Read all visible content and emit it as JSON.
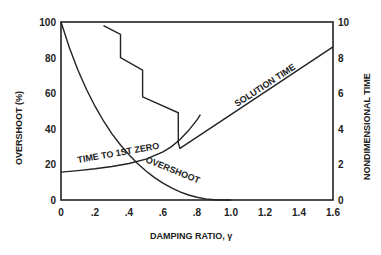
{
  "chart_data": {
    "type": "line",
    "title": "",
    "xlabel": "DAMPING RATIO, γ",
    "ylabel": "OVERSHOOT (%)",
    "y2label": "NONDIMENSIONAL TIME",
    "xlim": [
      0,
      1.6
    ],
    "ylim": [
      0,
      100
    ],
    "y2lim": [
      0,
      10
    ],
    "x_ticks": [
      "0",
      ".2",
      ".4",
      ".6",
      ".8",
      "1.0",
      "1.2",
      "1.4",
      "1.6"
    ],
    "x_tick_values": [
      0,
      0.2,
      0.4,
      0.6,
      0.8,
      1.0,
      1.2,
      1.4,
      1.6
    ],
    "y_ticks": [
      "0",
      "20",
      "40",
      "60",
      "80",
      "100"
    ],
    "y_tick_values": [
      0,
      20,
      40,
      60,
      80,
      100
    ],
    "y2_ticks": [
      "0",
      "2",
      "4",
      "6",
      "8",
      "10"
    ],
    "y2_tick_values": [
      0,
      2,
      4,
      6,
      8,
      10
    ],
    "grid": false,
    "series": [
      {
        "name": "OVERSHOOT",
        "axis": "left",
        "x": [
          0,
          0.05,
          0.1,
          0.15,
          0.2,
          0.25,
          0.3,
          0.35,
          0.4,
          0.45,
          0.5,
          0.55,
          0.6,
          0.65,
          0.7,
          0.75,
          0.8,
          0.85,
          0.9,
          0.95,
          1.0
        ],
        "y": [
          100,
          85.4,
          72.9,
          62.1,
          52.7,
          44.4,
          37.2,
          30.9,
          25.4,
          20.5,
          16.3,
          12.6,
          9.5,
          6.8,
          4.6,
          2.8,
          1.5,
          0.6,
          0.15,
          0.02,
          0
        ]
      },
      {
        "name": "TIME TO 1ST ZERO",
        "axis": "right",
        "x": [
          0,
          0.1,
          0.2,
          0.3,
          0.4,
          0.5,
          0.6,
          0.65,
          0.7,
          0.75,
          0.8,
          0.82
        ],
        "y": [
          1.57,
          1.65,
          1.75,
          1.88,
          2.05,
          2.3,
          2.7,
          3.0,
          3.4,
          3.9,
          4.5,
          4.8
        ]
      },
      {
        "name": "SOLUTION TIME",
        "axis": "right",
        "x": [
          0.25,
          0.35,
          0.35,
          0.48,
          0.48,
          0.69,
          0.69,
          0.7,
          1.6
        ],
        "y": [
          9.8,
          9.3,
          8.0,
          7.3,
          5.8,
          4.9,
          3.2,
          2.9,
          8.6
        ]
      }
    ],
    "annotations": [
      {
        "text": "TIME TO 1ST ZERO"
      },
      {
        "text": "OVERSHOOT"
      },
      {
        "text": "SOLUTION TIME"
      }
    ]
  }
}
